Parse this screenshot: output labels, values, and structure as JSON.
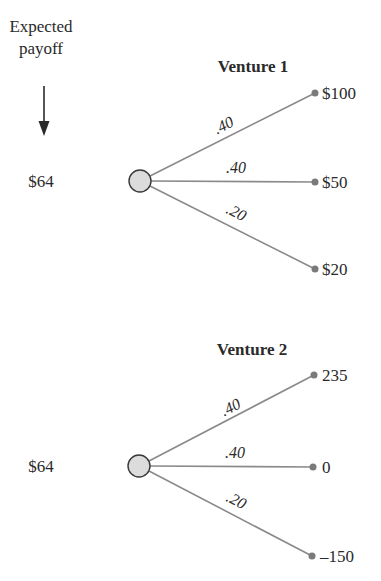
{
  "header": {
    "label_line1": "Expected",
    "label_line2": "payoff"
  },
  "ventures": [
    {
      "title": "Venture 1",
      "expected_payoff": "$64",
      "branches": [
        {
          "probability": ".40",
          "payoff": "$100"
        },
        {
          "probability": ".40",
          "payoff": "$50"
        },
        {
          "probability": ".20",
          "payoff": "$20"
        }
      ]
    },
    {
      "title": "Venture 2",
      "expected_payoff": "$64",
      "branches": [
        {
          "probability": ".40",
          "payoff": "235"
        },
        {
          "probability": ".40",
          "payoff": "0"
        },
        {
          "probability": ".20",
          "payoff": "–150"
        }
      ]
    }
  ],
  "colors": {
    "edge": "#8a8a8a",
    "node_fill": "#dcdcdc",
    "leaf": "#7a7a7a",
    "text": "#2a2a2a"
  }
}
